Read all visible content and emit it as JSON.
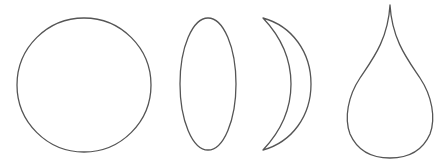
{
  "diagram": {
    "background": "#ffffff",
    "stroke_color": "#555555",
    "stroke_width": 1.3,
    "shapes": [
      {
        "name": "circle",
        "kind": "circle",
        "cx": 84,
        "cy": 85,
        "r": 67
      },
      {
        "name": "ellipse",
        "kind": "ellipse",
        "cx": 208,
        "cy": 84,
        "rx": 28,
        "ry": 66
      },
      {
        "name": "crescent",
        "kind": "path",
        "d": "M 263 18 C 292 26, 311 52, 311 84 C 311 116, 292 142, 263 150 C 282 130, 291 108, 291 84 C 291 60, 282 38, 263 18 Z"
      },
      {
        "name": "teardrop",
        "kind": "path",
        "d": "M 390 5 C 392 40, 408 60, 420 78 C 432 96, 436 118, 430 134 C 422 152, 406 158, 390 158 C 374 158, 358 152, 350 134 C 344 118, 348 96, 360 78 C 372 60, 388 40, 390 5 Z"
      }
    ]
  }
}
